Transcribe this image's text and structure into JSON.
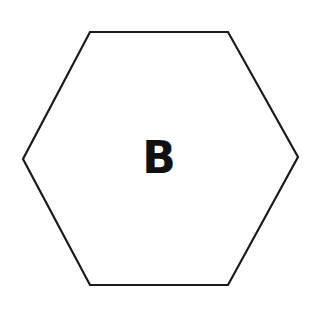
{
  "diagram": {
    "shape": "hexagon",
    "label": "B",
    "stroke_color": "#1a1a1a",
    "fill_color": "#ffffff",
    "vertices": [
      [
        90,
        32
      ],
      [
        228,
        32
      ],
      [
        298,
        157
      ],
      [
        228,
        285
      ],
      [
        90,
        285
      ],
      [
        23,
        159
      ]
    ]
  }
}
